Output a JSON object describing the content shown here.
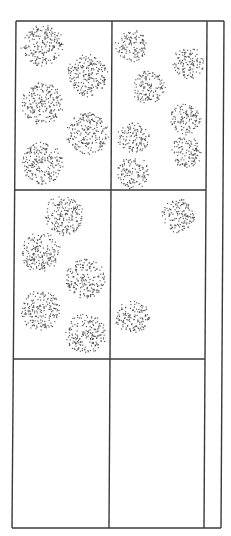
{
  "diagram": {
    "line_color": "#3a3a3a",
    "dot_color": "#4a4a4a",
    "frame": {
      "top_y": 21,
      "bottom_y": 528,
      "left_x_top": 16,
      "left_x_bottom": 12,
      "mid_x_top": 112,
      "mid_x_bottom": 109,
      "inner_right_x_top": 207,
      "inner_right_x_bottom": 204,
      "outer_right_x_top": 224,
      "outer_right_x_bottom": 221,
      "row_dividers_y": [
        190,
        359
      ]
    },
    "cells": [
      {
        "name": "cell-top-left",
        "blobs": [
          {
            "cx": 42,
            "cy": 45,
            "r": 21
          },
          {
            "cx": 87,
            "cy": 75,
            "r": 21
          },
          {
            "cx": 42,
            "cy": 103,
            "r": 21
          },
          {
            "cx": 87,
            "cy": 133,
            "r": 21
          },
          {
            "cx": 42,
            "cy": 163,
            "r": 21
          }
        ]
      },
      {
        "name": "cell-top-right",
        "blobs": [
          {
            "cx": 131,
            "cy": 45,
            "r": 16
          },
          {
            "cx": 188,
            "cy": 63,
            "r": 16
          },
          {
            "cx": 148,
            "cy": 87,
            "r": 17
          },
          {
            "cx": 185,
            "cy": 118,
            "r": 16
          },
          {
            "cx": 133,
            "cy": 137,
            "r": 16
          },
          {
            "cx": 185,
            "cy": 152,
            "r": 16
          },
          {
            "cx": 133,
            "cy": 172,
            "r": 16
          }
        ]
      },
      {
        "name": "cell-middle-left",
        "blobs": [
          {
            "cx": 63,
            "cy": 215,
            "r": 20
          },
          {
            "cx": 40,
            "cy": 252,
            "r": 20
          },
          {
            "cx": 85,
            "cy": 278,
            "r": 20
          },
          {
            "cx": 40,
            "cy": 310,
            "r": 20
          },
          {
            "cx": 85,
            "cy": 333,
            "r": 20
          }
        ]
      },
      {
        "name": "cell-middle-right",
        "blobs": [
          {
            "cx": 178,
            "cy": 215,
            "r": 17
          },
          {
            "cx": 132,
            "cy": 317,
            "r": 17
          }
        ]
      },
      {
        "name": "cell-bottom-left",
        "blobs": []
      },
      {
        "name": "cell-bottom-right",
        "blobs": []
      }
    ]
  }
}
